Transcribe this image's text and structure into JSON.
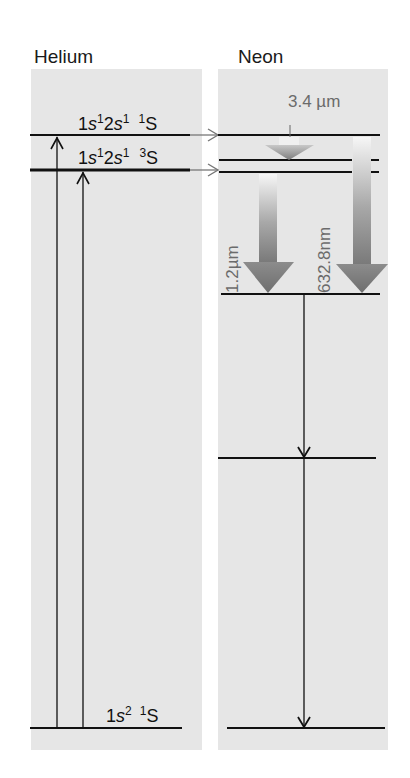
{
  "diagram": {
    "type": "energy-level-diagram",
    "panels": [
      {
        "title": "Helium",
        "levels": [
          {
            "id": "he-1s2s-1S",
            "config": "1s¹2s¹",
            "term": "¹S",
            "label": "1s12s1 1S"
          },
          {
            "id": "he-1s2s-3S",
            "config": "1s¹2s¹",
            "term": "³S",
            "label": "1s12s1 3S"
          },
          {
            "id": "he-ground",
            "config": "1s²",
            "term": "¹S",
            "label": "1s2 1S"
          }
        ],
        "transitions": [
          {
            "from": "he-ground",
            "to": "he-1s2s-1S",
            "direction": "up"
          },
          {
            "from": "he-ground",
            "to": "he-1s2s-3S",
            "direction": "up"
          }
        ]
      },
      {
        "title": "Neon",
        "levels": [
          {
            "id": "ne-upper-1"
          },
          {
            "id": "ne-upper-2"
          },
          {
            "id": "ne-upper-3"
          },
          {
            "id": "ne-lower"
          },
          {
            "id": "ne-intermediate"
          },
          {
            "id": "ne-ground"
          }
        ],
        "transitions": [
          {
            "from": "ne-upper-1",
            "to": "ne-upper-2",
            "label": "3.4 µm",
            "kind": "laser"
          },
          {
            "from": "ne-upper-3",
            "to": "ne-lower",
            "label": "1.2µm",
            "kind": "laser"
          },
          {
            "from": "ne-upper-1",
            "to": "ne-lower",
            "label": "632.8nm",
            "kind": "laser"
          },
          {
            "from": "ne-lower",
            "to": "ne-intermediate",
            "kind": "decay"
          },
          {
            "from": "ne-intermediate",
            "to": "ne-ground",
            "kind": "decay"
          }
        ]
      }
    ],
    "energy_transfer": [
      {
        "from": "he-1s2s-1S",
        "to": "ne-upper-1"
      },
      {
        "from": "he-1s2s-3S",
        "to": "ne-upper-3"
      }
    ]
  },
  "labels": {
    "helium_title": "Helium",
    "neon_title": "Neon",
    "he_level1_config_pre": "1",
    "he_level1_s1": "s",
    "he_level1_sup1": "1",
    "he_level1_mid": "2",
    "he_level1_s2": "s",
    "he_level1_sup2": "1",
    "he_level1_term_sup": "1",
    "he_level1_term": "S",
    "he_level2_term_sup": "3",
    "he_ground_sup": "2",
    "he_ground_term_sup": "1",
    "wl_34": "3.4  µm",
    "wl_12": "1.2µm",
    "wl_6328": "632.8nm"
  },
  "colors": {
    "panel_bg": "#e6e6e6",
    "line": "#111111",
    "arrow_dark": "#7a7a7a",
    "arrow_light": "#f4f4f4",
    "label_gray": "#6b6b6b"
  }
}
